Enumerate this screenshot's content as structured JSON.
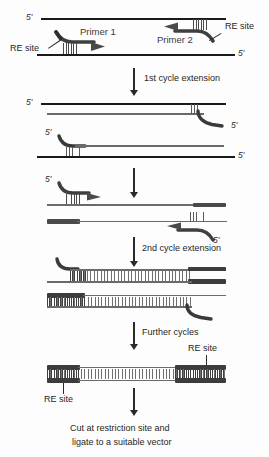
{
  "figure": {
    "colors": {
      "strand_dark": "#1a1a1a",
      "strand_grey": "#6a6a6a",
      "re_block": "#4a4a4a",
      "hatch": "#5a5a5a",
      "arrow": "#2a2a2a",
      "text": "#1f1f1f",
      "background": "#fdfdfd"
    }
  },
  "labels": {
    "five_prime": "5'",
    "re_site": "RE site",
    "primer_1": "Primer  1",
    "primer_2": "Primer 2"
  },
  "steps": [
    {
      "id": "step-1",
      "label": "1st cycle extension"
    },
    {
      "id": "step-2",
      "label": "2nd cycle extension"
    },
    {
      "id": "step-3",
      "label": "Further cycles"
    }
  ],
  "conclusion": {
    "line1": "Cut  at  restriction  site  and",
    "line2": "ligate  to  a  suitable  vector"
  },
  "stages": [
    {
      "id": "stage-template",
      "name": "original-template-duplex",
      "description": "Double-stranded template with Primer 1 annealing to the bottom strand and Primer 2 annealing to the top strand; both primers carry 5' restriction-enzyme site tails.",
      "five_prime_marks": [
        "top-left",
        "bottom-right"
      ],
      "re_sites": 2
    },
    {
      "id": "stage-cycle1-a",
      "name": "first-cycle-product-upper",
      "description": "Top template strand with newly synthesised strand extended from Primer 2; the 5' tail hook carries the RE site.",
      "five_prime_marks": [
        "top-left",
        "new-strand-right"
      ],
      "re_sites": 1
    },
    {
      "id": "stage-cycle1-b",
      "name": "first-cycle-product-lower",
      "description": "Bottom template strand with newly synthesised strand extended from Primer 1; the 5' tail hook carries the RE site.",
      "five_prime_marks": [
        "new-strand-left",
        "bottom-right"
      ],
      "re_sites": 1
    },
    {
      "id": "stage-cycle2-primed-a",
      "name": "second-cycle-primer1-annealed",
      "description": "Primer 1 annealed to a first-cycle product strand, ready for extension.",
      "re_sites": 1
    },
    {
      "id": "stage-cycle2-primed-b",
      "name": "second-cycle-primer2-annealed",
      "description": "Primer 2 annealed to the complementary first-cycle product strand, ready for extension.",
      "re_sites": 1
    },
    {
      "id": "stage-cycle2-product-a",
      "name": "second-cycle-product-upper",
      "description": "Duplex product with an RE site block incorporated at the right end and a free primer tail hook at the left.",
      "re_sites": 2
    },
    {
      "id": "stage-cycle2-product-b",
      "name": "second-cycle-product-lower",
      "description": "Duplex product with an RE site block incorporated at the left end and a free primer tail hook at the right.",
      "re_sites": 2
    },
    {
      "id": "stage-final",
      "name": "final-amplicon",
      "description": "Fully double-stranded amplicon flanked by restriction-enzyme sites at both ends, ready for digestion and ligation.",
      "re_sites": 2,
      "re_site_labels": [
        "RE site",
        "RE site"
      ]
    }
  ]
}
